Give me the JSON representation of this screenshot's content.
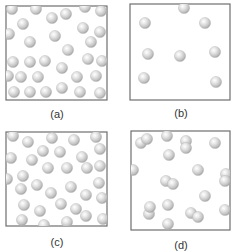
{
  "figure": {
    "sphere_color": "#c8c8c8",
    "sphere_highlight": "#ffffff",
    "sphere_shadow": "#8a8a8a",
    "border_color": "#6e6e6e",
    "panels": [
      {
        "id": "a",
        "label": "(a)",
        "particle_type": "single atoms",
        "density": "high",
        "particle_count": 31
      },
      {
        "id": "b",
        "label": "(b)",
        "particle_type": "single atoms",
        "density": "low",
        "particle_count": 8
      },
      {
        "id": "c",
        "label": "(c)",
        "particle_type": "single atoms",
        "density": "high",
        "particle_count": 33
      },
      {
        "id": "d",
        "label": "(d)",
        "particle_type": "mixture of diatomic molecules and single atoms",
        "density": "medium",
        "molecule_count": 6,
        "atom_count": 9
      }
    ]
  }
}
